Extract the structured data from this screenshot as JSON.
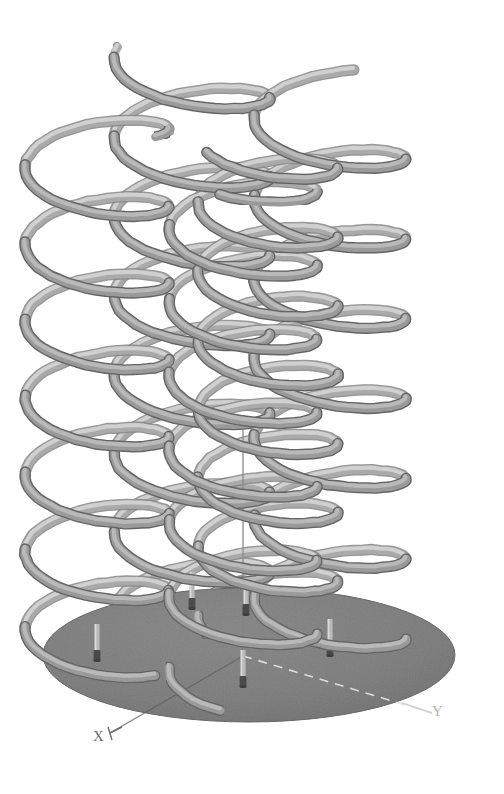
{
  "figure": {
    "type": "3d-plot",
    "title": "",
    "background_color": "#ffffff",
    "width": 504,
    "height": 794
  },
  "axes": {
    "x_label": "X",
    "y_label": "Y",
    "z_label": "",
    "x_label_color": "#6f6f6f",
    "y_label_color": "#b4b4b4",
    "z_axis_color": "#8a8a8a",
    "x_axis_style": "solid",
    "y_axis_style": "dashed",
    "z_axis_style": "solid"
  },
  "base_disk": {
    "name": "ground-plane-disk",
    "shape": "ellipse",
    "center_x": 249,
    "center_y": 655,
    "radius_x": 206,
    "radius_y": 67,
    "fill_color": "#858585",
    "edge_color": "#6e6e6e"
  },
  "chart_data": {
    "type": "scatter",
    "title": "",
    "xlabel": "X",
    "ylabel": "Y",
    "zlabel": "",
    "grid": false,
    "legend": "none",
    "object_type": "helix-tubes",
    "helix_count": 5,
    "turns_per_helix": 7,
    "tube_color_light": "#bcbcbc",
    "tube_color_mid": "#9a9a9a",
    "tube_color_dark": "#686868",
    "tube_radius_px": 5,
    "helices": [
      {
        "id": "helix-1",
        "base_x": 97,
        "base_y": 660,
        "top_y": 122,
        "coil_rx": 72,
        "coil_ry": 26,
        "turns": 7,
        "phase": 0.1,
        "depth": 1
      },
      {
        "id": "helix-2",
        "base_x": 192,
        "base_y": 608,
        "top_y": 55,
        "coil_rx": 78,
        "coil_ry": 27,
        "turns": 7,
        "phase": 0.55,
        "depth": 2
      },
      {
        "id": "helix-3",
        "base_x": 243,
        "base_y": 686,
        "top_y": 170,
        "coil_rx": 74,
        "coil_ry": 26,
        "turns": 7,
        "phase": 0.3,
        "depth": 0
      },
      {
        "id": "helix-4",
        "base_x": 330,
        "base_y": 655,
        "top_y": 95,
        "coil_rx": 76,
        "coil_ry": 26,
        "turns": 7,
        "phase": 0.8,
        "depth": 2
      },
      {
        "id": "helix-5",
        "base_x": 268,
        "base_y": 622,
        "top_y": 140,
        "coil_rx": 70,
        "coil_ry": 25,
        "turns": 7,
        "phase": 0.42,
        "depth": 1
      }
    ],
    "anchor_pins": [
      {
        "id": "pin-1",
        "x": 97,
        "y": 660
      },
      {
        "id": "pin-2",
        "x": 192,
        "y": 608
      },
      {
        "id": "pin-3",
        "x": 243,
        "y": 686
      },
      {
        "id": "pin-4",
        "x": 330,
        "y": 655
      },
      {
        "id": "pin-5",
        "x": 246,
        "y": 614
      }
    ],
    "z_axis": {
      "x": 243,
      "y_top": 428,
      "y_bottom": 656
    },
    "x_axis": {
      "x1": 243,
      "y1": 656,
      "x2": 110,
      "y2": 733
    },
    "y_axis": {
      "x1": 243,
      "y1": 656,
      "x2": 432,
      "y2": 713
    }
  }
}
